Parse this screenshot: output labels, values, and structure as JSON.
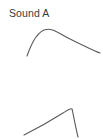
{
  "figure": {
    "background_color": "#ffffff",
    "line_color": "#5a5a5a",
    "text_color": "#3a3a3a",
    "width": 103,
    "height": 139
  },
  "panels": [
    {
      "id": "sound-a",
      "label": "Sound A",
      "description": "amplitude envelope with gradual attack and slow gentle decay"
    },
    {
      "id": "sound-b",
      "label": "Sound B",
      "description": "amplitude envelope with gradual attack and abrupt steep decay"
    }
  ],
  "chart_data": {
    "type": "line",
    "title": "",
    "xlabel": "",
    "ylabel": "",
    "grid": false,
    "legend": "none",
    "xlim": [
      0,
      103
    ],
    "ylim": [
      0,
      70
    ],
    "series": [
      {
        "name": "Sound A",
        "comment": "points are pixel coordinates within the Sound A panel (x right, y down)",
        "x": [
          27,
          31,
          36,
          41,
          46,
          52,
          58,
          65,
          73,
          82,
          91,
          100
        ],
        "y": [
          56,
          47,
          39,
          33,
          30,
          30,
          32,
          35,
          39,
          44,
          49,
          53
        ],
        "path_d": "M27,56 C30,48 35,34 44,30 C52,27 58,33 68,38 C80,44 92,50 100,53"
      },
      {
        "name": "Sound B",
        "comment": "points are pixel coordinates within the Sound B panel (x right, y down)",
        "x": [
          24,
          30,
          37,
          45,
          53,
          60,
          66,
          70,
          72,
          74,
          76,
          78
        ],
        "y": [
          65,
          62,
          58,
          53,
          48,
          44,
          41,
          39,
          42,
          50,
          59,
          67
        ],
        "path_d": "M24,65 C34,60 52,50 63,43 C68,40 71,38 72,39 C73,42 75,55 78,67"
      }
    ]
  }
}
